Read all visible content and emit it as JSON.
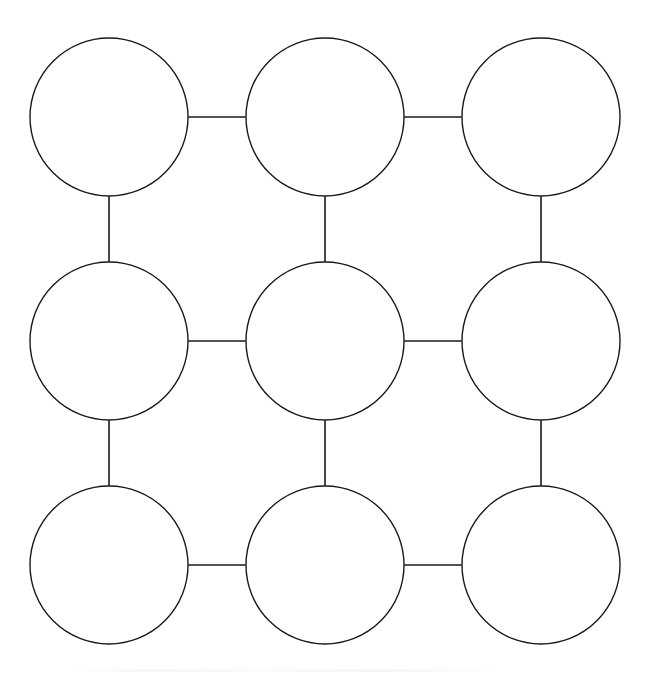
{
  "canvas": {
    "width": 650,
    "height": 684,
    "background_color": "#ffffff",
    "stroke_color": "#1a1a1a"
  },
  "diagram": {
    "title": "",
    "type": "circle-grid-concept-map",
    "node_radius": 79,
    "node_count": 9,
    "edge_count": 12,
    "nodes": [
      {
        "id": "n1",
        "label": "",
        "row": 1,
        "col": 1,
        "cx": 109,
        "cy": 117,
        "r": 79
      },
      {
        "id": "n2",
        "label": "",
        "row": 1,
        "col": 2,
        "cx": 325,
        "cy": 117,
        "r": 79
      },
      {
        "id": "n3",
        "label": "",
        "row": 1,
        "col": 3,
        "cx": 541,
        "cy": 117,
        "r": 79
      },
      {
        "id": "n4",
        "label": "",
        "row": 2,
        "col": 1,
        "cx": 109,
        "cy": 341,
        "r": 79
      },
      {
        "id": "n5",
        "label": "",
        "row": 2,
        "col": 2,
        "cx": 325,
        "cy": 341,
        "r": 79
      },
      {
        "id": "n6",
        "label": "",
        "row": 2,
        "col": 3,
        "cx": 541,
        "cy": 341,
        "r": 79
      },
      {
        "id": "n7",
        "label": "",
        "row": 3,
        "col": 1,
        "cx": 109,
        "cy": 565,
        "r": 79
      },
      {
        "id": "n8",
        "label": "",
        "row": 3,
        "col": 2,
        "cx": 325,
        "cy": 565,
        "r": 79
      },
      {
        "id": "n9",
        "label": "",
        "row": 3,
        "col": 3,
        "cx": 541,
        "cy": 565,
        "r": 79
      }
    ],
    "edges": [
      {
        "id": "e1",
        "from": "n1",
        "to": "n2",
        "orientation": "horizontal",
        "x1": 188,
        "y1": 117,
        "x2": 246,
        "y2": 117
      },
      {
        "id": "e2",
        "from": "n2",
        "to": "n3",
        "orientation": "horizontal",
        "x1": 404,
        "y1": 117,
        "x2": 462,
        "y2": 117
      },
      {
        "id": "e3",
        "from": "n4",
        "to": "n5",
        "orientation": "horizontal",
        "x1": 188,
        "y1": 341,
        "x2": 246,
        "y2": 341
      },
      {
        "id": "e4",
        "from": "n5",
        "to": "n6",
        "orientation": "horizontal",
        "x1": 404,
        "y1": 341,
        "x2": 462,
        "y2": 341
      },
      {
        "id": "e5",
        "from": "n7",
        "to": "n8",
        "orientation": "horizontal",
        "x1": 188,
        "y1": 565,
        "x2": 246,
        "y2": 565
      },
      {
        "id": "e6",
        "from": "n8",
        "to": "n9",
        "orientation": "horizontal",
        "x1": 404,
        "y1": 565,
        "x2": 462,
        "y2": 565
      },
      {
        "id": "e7",
        "from": "n1",
        "to": "n4",
        "orientation": "vertical",
        "x1": 109,
        "y1": 196,
        "x2": 109,
        "y2": 262
      },
      {
        "id": "e8",
        "from": "n2",
        "to": "n5",
        "orientation": "vertical",
        "x1": 325,
        "y1": 196,
        "x2": 325,
        "y2": 262
      },
      {
        "id": "e9",
        "from": "n3",
        "to": "n6",
        "orientation": "vertical",
        "x1": 541,
        "y1": 196,
        "x2": 541,
        "y2": 262
      },
      {
        "id": "e10",
        "from": "n4",
        "to": "n7",
        "orientation": "vertical",
        "x1": 109,
        "y1": 420,
        "x2": 109,
        "y2": 486
      },
      {
        "id": "e11",
        "from": "n5",
        "to": "n8",
        "orientation": "vertical",
        "x1": 325,
        "y1": 420,
        "x2": 325,
        "y2": 486
      },
      {
        "id": "e12",
        "from": "n6",
        "to": "n9",
        "orientation": "vertical",
        "x1": 541,
        "y1": 420,
        "x2": 541,
        "y2": 486
      }
    ]
  }
}
